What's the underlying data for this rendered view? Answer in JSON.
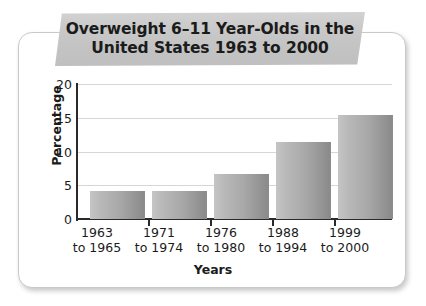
{
  "chart_data": {
    "type": "bar",
    "title": "Overweight 6–11 Year-Olds in the United States 1963 to 2000",
    "title_line1": "Overweight 6–11 Year-Olds in the",
    "title_line2": "United States 1963 to 2000",
    "categories": [
      "1963 to 1965",
      "1971 to 1974",
      "1976 to 1980",
      "1988 to 1994",
      "1999 to 2000"
    ],
    "category_lines": [
      {
        "line1": "1963",
        "line2": "to 1965"
      },
      {
        "line1": "1971",
        "line2": "to 1974"
      },
      {
        "line1": "1976",
        "line2": "to 1980"
      },
      {
        "line1": "1988",
        "line2": "to 1994"
      },
      {
        "line1": "1999",
        "line2": "to 2000"
      }
    ],
    "values": [
      4.1,
      4.1,
      6.7,
      11.4,
      15.4
    ],
    "xlabel": "Years",
    "ylabel": "Percentage",
    "ylim": [
      0,
      20
    ],
    "yticks": [
      "0",
      "5",
      "10",
      "15",
      "20"
    ],
    "grid": true,
    "legend": "none",
    "bar_color": "#a8a8a8",
    "banner_color": "#c6c6c6",
    "text_color": "#1b1b1b"
  }
}
